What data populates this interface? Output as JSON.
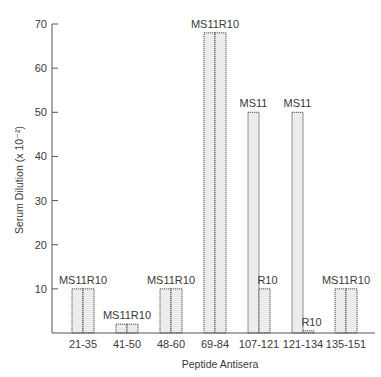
{
  "chart_data": {
    "type": "bar",
    "title": "",
    "xlabel": "Peptide Antisera",
    "ylabel": "Serum Dilution (x 10⁻²)",
    "ylim": [
      0,
      70
    ],
    "yticks": [
      10,
      20,
      30,
      40,
      50,
      60,
      70
    ],
    "grid": false,
    "legend": "none (bars labeled directly)",
    "categories": [
      "21-35",
      "41-50",
      "48-60",
      "69-84",
      "107-121",
      "121-134",
      "135-151"
    ],
    "series": [
      {
        "name": "MS11",
        "values": [
          10,
          2,
          10,
          68,
          50,
          50,
          10
        ]
      },
      {
        "name": "R10",
        "values": [
          10,
          2,
          10,
          68,
          10,
          0.5,
          10
        ]
      }
    ],
    "bar_labels": [
      "MS11R10",
      "MS11R10",
      "MS11R10",
      "MS11R10",
      "MS11",
      "MS11",
      "MS11R10"
    ],
    "secondary_labels": [
      "",
      "",
      "",
      "",
      "R10",
      "R10",
      ""
    ]
  },
  "colors": {
    "axis": "#555555",
    "bar_fill": "#ececec",
    "bar_stroke": "#3a3a3a",
    "text": "#3a3a3a"
  }
}
